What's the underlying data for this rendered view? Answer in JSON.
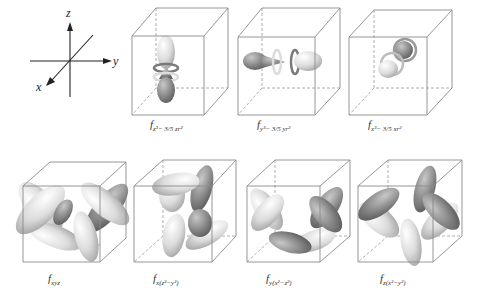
{
  "axes": {
    "x_label": "x",
    "y_label": "y",
    "z_label": "z"
  },
  "orbitals": [
    {
      "id": "fz3",
      "label": "f",
      "subscript": "z³− 3/5 zr²",
      "row": 1,
      "shape": "axial-z"
    },
    {
      "id": "fy3",
      "label": "f",
      "subscript": "y³− 3/5 yr²",
      "row": 1,
      "shape": "axial-y"
    },
    {
      "id": "fx3",
      "label": "f",
      "subscript": "x³− 3/5 xr²",
      "row": 1,
      "shape": "axial-x"
    },
    {
      "id": "fxyz",
      "label": "f",
      "subscript": "xyz",
      "row": 2,
      "shape": "eight-lobe"
    },
    {
      "id": "fx",
      "label": "f",
      "subscript": "x(z²−y²)",
      "row": 2,
      "shape": "eight-lobe"
    },
    {
      "id": "fy",
      "label": "f",
      "subscript": "y(x²−z²)",
      "row": 2,
      "shape": "eight-lobe"
    },
    {
      "id": "fz",
      "label": "f",
      "subscript": "z(x²−y²)",
      "row": 2,
      "shape": "eight-lobe"
    }
  ],
  "colors": {
    "lobe_light": "#e6e6e6",
    "lobe_dark": "#8c8c8c",
    "cube_edge": "#8a8a8a"
  }
}
